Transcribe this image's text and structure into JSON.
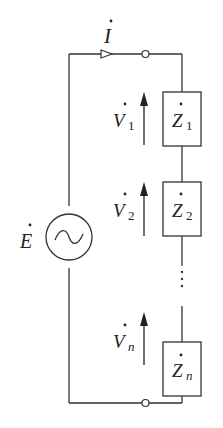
{
  "diagram": {
    "current": {
      "symbol": "I",
      "dot": true
    },
    "source": {
      "symbol": "E",
      "dot": true,
      "type": "ac-source"
    },
    "elements": [
      {
        "voltage": "V",
        "voltage_sub": "1",
        "impedance": "Z",
        "impedance_sub": "1"
      },
      {
        "voltage": "V",
        "voltage_sub": "2",
        "impedance": "Z",
        "impedance_sub": "2"
      },
      {
        "voltage": "V",
        "voltage_sub": "n",
        "impedance": "Z",
        "impedance_sub": "n"
      }
    ],
    "ellipsis": "⋮",
    "colors": {
      "line": "#333333",
      "background": "#ffffff"
    }
  }
}
